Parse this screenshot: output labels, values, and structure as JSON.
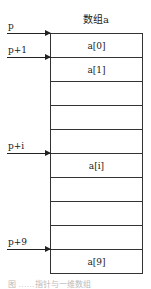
{
  "array": {
    "title": "数组a",
    "cells": [
      "a[0]",
      "a[1]",
      "",
      "",
      "",
      "a[i]",
      "",
      "",
      "",
      "a[9]"
    ]
  },
  "pointers": [
    {
      "label": "p",
      "row": 0
    },
    {
      "label": "p+1",
      "row": 1
    },
    {
      "label": "p+i",
      "row": 5
    },
    {
      "label": "p+9",
      "row": 9
    }
  ],
  "caption": "图 ……指针与一维数组"
}
